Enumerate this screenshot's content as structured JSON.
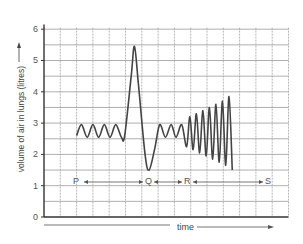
{
  "chart_data": {
    "type": "line",
    "title": "",
    "xlabel": "time",
    "ylabel": "volume of air in lungs (litres)",
    "ylim": [
      0,
      6
    ],
    "yticks": [
      0,
      1,
      2,
      3,
      4,
      5,
      6
    ],
    "grid": true,
    "gridlines_y_step": 0.5,
    "x_units": "grid divisions (unlabelled time axis)",
    "series": [
      {
        "name": "lung volume",
        "points": [
          [
            2.0,
            2.6
          ],
          [
            2.3,
            2.95
          ],
          [
            2.65,
            2.55
          ],
          [
            3.0,
            2.95
          ],
          [
            3.35,
            2.55
          ],
          [
            3.7,
            2.95
          ],
          [
            4.05,
            2.55
          ],
          [
            4.4,
            2.95
          ],
          [
            4.75,
            2.55
          ],
          [
            4.95,
            2.6
          ],
          [
            5.35,
            4.5
          ],
          [
            5.55,
            5.45
          ],
          [
            5.8,
            4.2
          ],
          [
            6.2,
            2.0
          ],
          [
            6.45,
            1.5
          ],
          [
            6.8,
            2.2
          ],
          [
            7.1,
            2.95
          ],
          [
            7.45,
            2.55
          ],
          [
            7.8,
            2.95
          ],
          [
            8.1,
            2.55
          ],
          [
            8.45,
            2.95
          ],
          [
            8.75,
            2.25
          ],
          [
            8.95,
            3.2
          ],
          [
            9.15,
            2.15
          ],
          [
            9.35,
            3.3
          ],
          [
            9.55,
            2.05
          ],
          [
            9.75,
            3.4
          ],
          [
            9.95,
            1.95
          ],
          [
            10.15,
            3.5
          ],
          [
            10.35,
            1.85
          ],
          [
            10.55,
            3.6
          ],
          [
            10.75,
            1.75
          ],
          [
            10.95,
            3.7
          ],
          [
            11.15,
            1.65
          ],
          [
            11.35,
            3.85
          ],
          [
            11.55,
            1.5
          ]
        ]
      }
    ],
    "annotations": [
      {
        "label": "P",
        "x": 2.0,
        "y": 1.2
      },
      {
        "label": "Q",
        "x": 6.4,
        "y": 1.2
      },
      {
        "label": "R",
        "x": 8.8,
        "y": 1.2
      },
      {
        "label": "S",
        "x": 13.7,
        "y": 1.2
      }
    ],
    "segments": [
      {
        "from": "P",
        "to": "Q",
        "note": "normal quiet breathing"
      },
      {
        "from": "Q",
        "to": "R",
        "note": "deep breath in and forced exhalation"
      },
      {
        "from": "R",
        "to": "S",
        "note": "increasing breathing depth/rate"
      }
    ]
  },
  "labels": {
    "ylabel": "volume of air in lungs (litres)",
    "xlabel": "time",
    "yticks": [
      "0",
      "1",
      "2",
      "3",
      "4",
      "5",
      "6"
    ],
    "points": [
      "P",
      "Q",
      "R",
      "S"
    ]
  },
  "colors": {
    "line": "#444444",
    "grid": "#9a9a9a",
    "axis": "#333333"
  }
}
